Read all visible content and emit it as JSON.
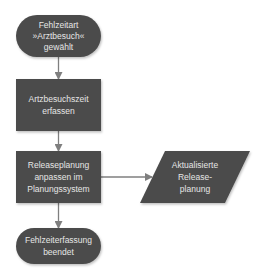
{
  "diagram": {
    "type": "flowchart",
    "colors": {
      "shape_fill": "#4b4b4b",
      "shape_text": "#e6e6e6",
      "connector": "#7f7f7f",
      "background": "#ffffff"
    },
    "nodes": [
      {
        "id": "start",
        "kind": "terminator",
        "lines": [
          "Fehlzeitart",
          "»Arztbesuch«",
          "gewählt"
        ]
      },
      {
        "id": "capture",
        "kind": "process",
        "lines": [
          "Artzbesuchszeit",
          "erfassen"
        ]
      },
      {
        "id": "adjust",
        "kind": "process",
        "lines": [
          "Releaseplanung",
          "anpassen im",
          "Planungssystem"
        ]
      },
      {
        "id": "output",
        "kind": "data",
        "lines": [
          "Aktualisierte",
          "Release-",
          "planung"
        ]
      },
      {
        "id": "end",
        "kind": "terminator",
        "lines": [
          "Fehlzeiterfassung",
          "beendet"
        ]
      }
    ],
    "edges": [
      {
        "from": "start",
        "to": "capture"
      },
      {
        "from": "capture",
        "to": "adjust"
      },
      {
        "from": "adjust",
        "to": "output"
      },
      {
        "from": "adjust",
        "to": "end"
      }
    ]
  }
}
